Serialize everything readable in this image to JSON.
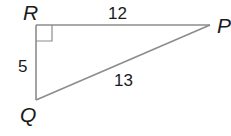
{
  "diagram": {
    "type": "right-triangle",
    "vertices": {
      "R": {
        "label": "R"
      },
      "P": {
        "label": "P"
      },
      "Q": {
        "label": "Q"
      }
    },
    "sides": {
      "RP": {
        "label": "12"
      },
      "RQ": {
        "label": "5"
      },
      "QP": {
        "label": "13"
      }
    },
    "right_angle_at": "R",
    "line_color": "#8c8c8c",
    "text_color": "#1a1a1a"
  }
}
